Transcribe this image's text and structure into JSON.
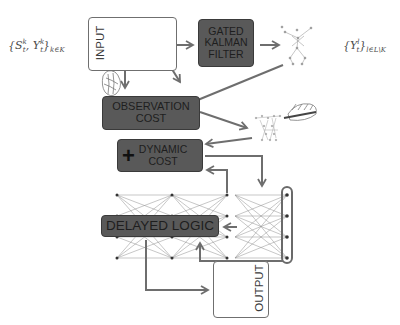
{
  "diagram": {
    "math_left": "{Sₜᵏ, Yₜᵏ}ₖ∈ₖ",
    "math_left_parts": {
      "open": "{",
      "s": "S",
      "y": "Y",
      "sup": "k",
      "sub": "t",
      "close": "}",
      "index": "k∈K"
    },
    "math_right_parts": {
      "open": "{",
      "y": "Y",
      "sup": "l",
      "sub": "t",
      "close": "}",
      "index": "l∈L\\K"
    },
    "nodes": {
      "input": {
        "label": "INPUT"
      },
      "kalman": {
        "label_lines": [
          "GATED",
          "KALMAN",
          "FILTER"
        ]
      },
      "observation": {
        "label_lines": [
          "OBSERVATION",
          "COST"
        ]
      },
      "dynamic": {
        "plus": "+",
        "label_lines": [
          "DYNAMIC",
          "COST"
        ]
      },
      "delayed": {
        "label": "DELAYED LOGIC"
      },
      "output": {
        "label": "OUTPUT"
      }
    },
    "colors": {
      "box_fill": "#595959",
      "box_text": "#1e1e1e",
      "arrow": "#707070",
      "line": "#8a8a8a",
      "node": "#333333"
    }
  }
}
